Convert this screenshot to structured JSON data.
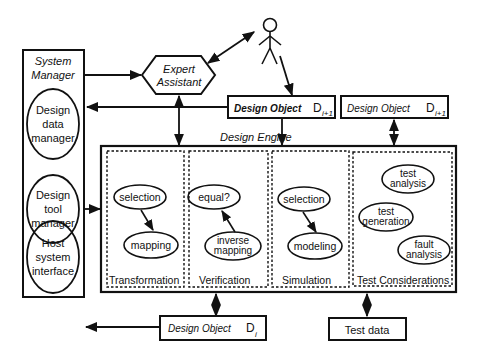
{
  "system_manager": {
    "title_line1": "System",
    "title_line2": "Manager",
    "components": [
      {
        "line1": "Design",
        "line2": "data",
        "line3": "manager"
      },
      {
        "line1": "Design",
        "line2": "tool",
        "line3": "manager"
      },
      {
        "line1": "Host",
        "line2": "system",
        "line3": "interface"
      }
    ]
  },
  "expert_assistant": {
    "line1": "Expert",
    "line2": "Assistant"
  },
  "user_icon": "stick-figure-user-icon",
  "design_objects": {
    "next_main": {
      "label": "Design  Object",
      "symbol": "D",
      "subscript": "i+1"
    },
    "next_test": {
      "label": "Design  Object",
      "symbol": "D",
      "subscript": "i+1"
    },
    "current": {
      "label": "Design  Object",
      "symbol": "D",
      "subscript": "i"
    }
  },
  "design_engine": {
    "title": "Design   Engine",
    "panels": [
      {
        "label": "Transformation",
        "nodes": [
          "selection",
          "mapping"
        ]
      },
      {
        "label": "Verification",
        "nodes": [
          "equal?",
          "inverse",
          "mapping"
        ]
      },
      {
        "label": "Simulation",
        "nodes": [
          "selection",
          "modeling"
        ]
      },
      {
        "label": "Test   Considerations",
        "nodes": [
          "test",
          "analysis",
          "test",
          "generation",
          "fault",
          "analysis"
        ]
      }
    ]
  },
  "test_data": {
    "label": "Test data"
  }
}
